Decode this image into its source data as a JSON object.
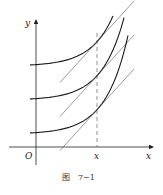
{
  "figure": {
    "caption": "图　7−1",
    "axis_labels": {
      "x": "x",
      "y": "y",
      "origin": "O",
      "x_marker": "x"
    },
    "curve_count": 3,
    "colors": {
      "curve": "#1a1a1a",
      "tangent": "#555555",
      "axis": "#222222",
      "dashed": "#666666"
    }
  }
}
